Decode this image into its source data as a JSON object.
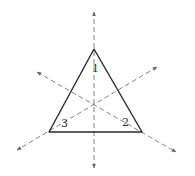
{
  "diagram": {
    "triangle": {
      "vertices": [
        [
          94,
          49
        ],
        [
          49,
          132
        ],
        [
          142,
          132
        ]
      ],
      "stroke": "#2a2a2a"
    },
    "axes": [
      {
        "id": 1,
        "label": "1",
        "from": [
          94,
          168
        ],
        "to": [
          94,
          12
        ],
        "label_pos": [
          92,
          72
        ]
      },
      {
        "id": 2,
        "label": "2",
        "from": [
          37,
          72
        ],
        "to": [
          176,
          152
        ],
        "label_pos": [
          122,
          126
        ]
      },
      {
        "id": 3,
        "label": "3",
        "from": [
          157,
          67
        ],
        "to": [
          17,
          150
        ],
        "label_pos": [
          61,
          127
        ]
      }
    ],
    "axis_color": "#666666"
  }
}
